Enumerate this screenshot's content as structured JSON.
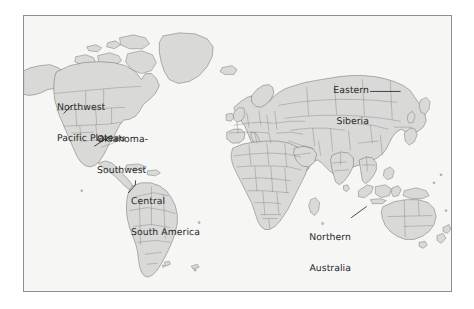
{
  "figure": {
    "kind": "world-map",
    "title": "",
    "projection": "robinson",
    "frame": {
      "border_color": "#8e8e8e"
    },
    "colors": {
      "ocean": "#f6f6f5",
      "land": "#d9d9d7",
      "coastline": "#5d5d5d",
      "country_border": "#6e6e6e",
      "label_text": "#2a2a2a",
      "leader_line": "#1d1d1d",
      "page_background": "#ffffff"
    }
  },
  "annotations": [
    {
      "id": "northwest-pacific-plateau",
      "lines": [
        "Northwest",
        "Pacific Plateau"
      ],
      "line1": "Northwest",
      "line2": "Pacific Plateau",
      "align": "left",
      "region": "Pacific Northwest, North America"
    },
    {
      "id": "oklahoma-southwest",
      "lines": [
        "Oklahoma-",
        "Southwest"
      ],
      "line1": "Oklahoma-",
      "line2": "Southwest",
      "align": "left",
      "region": "South-central and southwestern United States"
    },
    {
      "id": "central-south-america",
      "lines": [
        "Central",
        "South America"
      ],
      "line1": "Central",
      "line2": "South America",
      "align": "left",
      "region": "Central South America"
    },
    {
      "id": "eastern-siberia",
      "lines": [
        "Eastern",
        "Siberia"
      ],
      "line1": "Eastern",
      "line2": "Siberia",
      "align": "right",
      "region": "Eastern Siberia, Russia"
    },
    {
      "id": "northern-australia",
      "lines": [
        "Northern",
        "Australia"
      ],
      "line1": "Northern",
      "line2": "Australia",
      "align": "right",
      "region": "Northern Australia"
    }
  ]
}
